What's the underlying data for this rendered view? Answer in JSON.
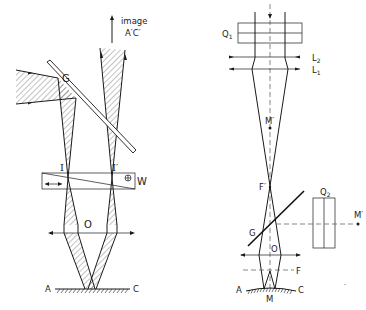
{
  "figure": {
    "left_diagram": {
      "labels": {
        "image": "image",
        "image_points": "A′C′",
        "plate": "G",
        "intermediate_left": "I",
        "intermediate_right": "I′",
        "prism": "W",
        "prism_symbol": "⊕",
        "objective": "O",
        "point_a": "A",
        "point_c": "C"
      }
    },
    "right_diagram": {
      "labels": {
        "quartz_1": "Q",
        "quartz_1_sub": "1",
        "lens_2": "L",
        "lens_2_sub": "2",
        "lens_1": "L",
        "lens_1_sub": "1",
        "m_prime_axis": "M′",
        "focal_prime": "F′",
        "quartz_2": "Q",
        "quartz_2_sub": "2",
        "m_prime_side": "M′",
        "plate": "G",
        "objective": "O",
        "focal": "F",
        "point_a": "A",
        "point_m": "M",
        "point_c": "C"
      }
    }
  }
}
